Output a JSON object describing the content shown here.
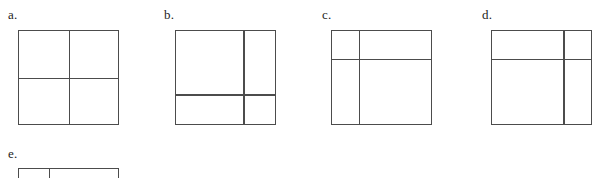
{
  "page": {
    "background_color": "#ffffff",
    "line_color": "#4c4c4c",
    "width": 605,
    "height": 178
  },
  "figures": [
    {
      "id": "a",
      "label": "a.",
      "shape": "square",
      "vertical_divider_pct": 50,
      "horizontal_divider_pct": 50,
      "regions": 4,
      "clipped": false
    },
    {
      "id": "b",
      "label": "b.",
      "shape": "square",
      "vertical_divider_pct": 68,
      "horizontal_divider_pct": 68,
      "regions": 4,
      "clipped": false
    },
    {
      "id": "c",
      "label": "c.",
      "shape": "square",
      "vertical_divider_pct": 27,
      "horizontal_divider_pct": 30,
      "regions": 4,
      "clipped": false
    },
    {
      "id": "d",
      "label": "d.",
      "shape": "square",
      "vertical_divider_pct": 72,
      "horizontal_divider_pct": 30,
      "regions": 4,
      "clipped": false
    },
    {
      "id": "e",
      "label": "e.",
      "shape": "square",
      "vertical_divider_pct": 30,
      "horizontal_divider_pct": null,
      "regions": 2,
      "clipped": true
    }
  ]
}
